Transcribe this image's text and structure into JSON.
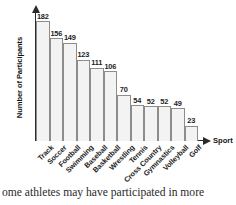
{
  "chart_data": {
    "type": "bar",
    "title": "",
    "subtitle": "",
    "xlabel": "Sport",
    "ylabel": "Number of Participants",
    "categories": [
      "Track",
      "Soccer",
      "Football",
      "Swimming",
      "Baseball",
      "Basketball",
      "Wrestling",
      "Tennis",
      "Cross Country",
      "Gymnastics",
      "Volleyball",
      "Golf"
    ],
    "values": [
      182,
      156,
      149,
      123,
      111,
      106,
      70,
      54,
      52,
      52,
      49,
      23
    ],
    "value_labels": [
      "182",
      "156",
      "149",
      "123",
      "111",
      "106",
      "70",
      "54",
      "52",
      "52",
      "49",
      "23"
    ],
    "ylim": [
      0,
      196
    ],
    "xlim_ticks": [],
    "grid": false,
    "legend": null,
    "legend_position": "none",
    "annotations": [],
    "bar_style": {
      "fill": "#f3f3f3",
      "stroke": "#8d8d8d",
      "gap": 0
    },
    "axis_style": {
      "color": "#2b2b2b",
      "y_arrow": true,
      "x_arrow": true,
      "tick_labels_on_y": false
    }
  },
  "caption": {
    "text": "ome athletes may have participated in more"
  }
}
